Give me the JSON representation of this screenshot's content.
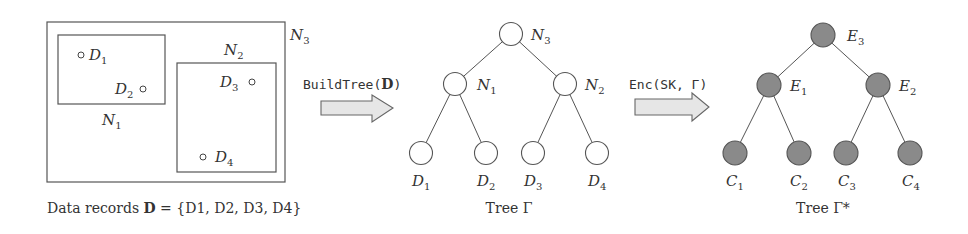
{
  "figure": {
    "colors": {
      "stroke": "#555555",
      "text": "#333333",
      "encrypted_node_fill": "#8a8a8a",
      "arrow_fill": "#e6e6e6",
      "background": "#ffffff"
    },
    "panel_data": {
      "caption_prefix": "Data records ",
      "caption_bold": "D",
      "caption_suffix": " = {D1, D2, D3, D4}",
      "regions": [
        {
          "label": "N",
          "sub": "3"
        },
        {
          "label": "N",
          "sub": "1"
        },
        {
          "label": "N",
          "sub": "2"
        }
      ],
      "points": [
        {
          "label": "D",
          "sub": "1"
        },
        {
          "label": "D",
          "sub": "2"
        },
        {
          "label": "D",
          "sub": "3"
        },
        {
          "label": "D",
          "sub": "4"
        }
      ]
    },
    "arrow_build": {
      "label_func": "BuildTree(",
      "label_arg": "D",
      "label_close": ")"
    },
    "tree_plain": {
      "caption": "Tree Γ",
      "internal_nodes": [
        {
          "label": "N",
          "sub": "3"
        },
        {
          "label": "N",
          "sub": "1"
        },
        {
          "label": "N",
          "sub": "2"
        }
      ],
      "leaves": [
        {
          "label": "D",
          "sub": "1"
        },
        {
          "label": "D",
          "sub": "2"
        },
        {
          "label": "D",
          "sub": "3"
        },
        {
          "label": "D",
          "sub": "4"
        }
      ]
    },
    "arrow_enc": {
      "label": "Enc(SK, Γ)"
    },
    "tree_encrypted": {
      "caption": "Tree Γ*",
      "internal_nodes": [
        {
          "label": "E",
          "sub": "3"
        },
        {
          "label": "E",
          "sub": "1"
        },
        {
          "label": "E",
          "sub": "2"
        }
      ],
      "leaves": [
        {
          "label": "C",
          "sub": "1"
        },
        {
          "label": "C",
          "sub": "2"
        },
        {
          "label": "C",
          "sub": "3"
        },
        {
          "label": "C",
          "sub": "4"
        }
      ]
    }
  }
}
